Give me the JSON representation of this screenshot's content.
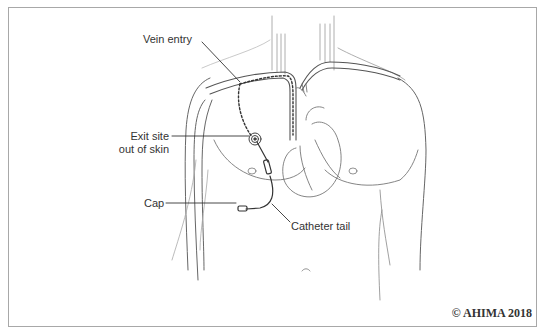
{
  "diagram": {
    "type": "anatomical-illustration",
    "labels": {
      "vein_entry": "Vein entry",
      "exit_site_line1": "Exit site",
      "exit_site_line2": "out of skin",
      "cap": "Cap",
      "catheter_tail": "Catheter tail"
    },
    "copyright": "© AHIMA 2018",
    "colors": {
      "line": "#555555",
      "light_line": "#9a9a9a",
      "text": "#333333",
      "border": "#a8a8a8"
    }
  }
}
